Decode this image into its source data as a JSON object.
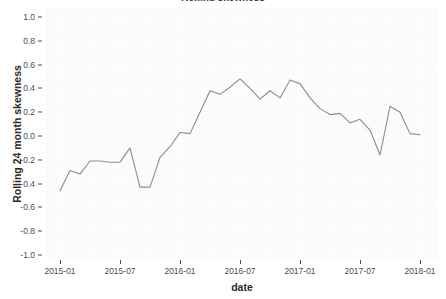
{
  "chart_data": {
    "type": "line",
    "title": "Rolling skewness",
    "xlabel": "date",
    "ylabel": "Rolling 24  month skewness",
    "ylim": [
      -1.0,
      1.0
    ],
    "xlim": [
      "2015-01",
      "2018-01"
    ],
    "grid": true,
    "legend": "none",
    "line_color": "#8c8c8c",
    "panel_background": "#fbfbfb",
    "gridline_color": "#ffffff",
    "y_ticks": [
      "1.0",
      "0.8",
      "0.6",
      "0.4",
      "0.2",
      "0.0",
      "-0.2",
      "-0.4",
      "-0.6",
      "-0.8",
      "-1.0"
    ],
    "y_tick_values": [
      1.0,
      0.8,
      0.6,
      0.4,
      0.2,
      0.0,
      -0.2,
      -0.4,
      -0.6,
      -0.8,
      -1.0
    ],
    "x_ticks": [
      "2015-01",
      "2015-07",
      "2016-01",
      "2016-07",
      "2017-01",
      "2017-07",
      "2018-01"
    ],
    "series": [
      {
        "name": "Rolling 24 month skewness",
        "x": [
          "2015-01",
          "2015-02",
          "2015-03",
          "2015-04",
          "2015-05",
          "2015-06",
          "2015-07",
          "2015-08",
          "2015-09",
          "2015-10",
          "2015-11",
          "2015-12",
          "2016-01",
          "2016-02",
          "2016-03",
          "2016-04",
          "2016-05",
          "2016-06",
          "2016-07",
          "2016-08",
          "2016-09",
          "2016-10",
          "2016-11",
          "2016-12",
          "2017-01",
          "2017-02",
          "2017-03",
          "2017-04",
          "2017-05",
          "2017-06",
          "2017-07",
          "2017-08",
          "2017-09",
          "2017-10",
          "2017-11",
          "2017-12",
          "2018-01"
        ],
        "values": [
          -0.46,
          -0.29,
          -0.32,
          -0.21,
          -0.21,
          -0.22,
          -0.22,
          -0.1,
          -0.43,
          -0.43,
          -0.18,
          -0.09,
          0.03,
          0.02,
          0.2,
          0.38,
          0.35,
          0.41,
          0.48,
          0.4,
          0.31,
          0.38,
          0.32,
          0.47,
          0.44,
          0.32,
          0.23,
          0.18,
          0.19,
          0.11,
          0.14,
          0.05,
          -0.16,
          0.25,
          0.2,
          0.02,
          0.01
        ]
      }
    ]
  }
}
